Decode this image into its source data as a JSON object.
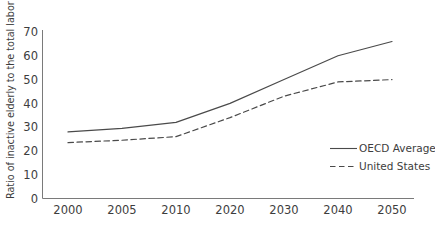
{
  "chart_data": {
    "type": "line",
    "title": "",
    "xlabel": "",
    "ylabel": "Ratio of inactive elderly to the total labor force",
    "categories": [
      "2000",
      "2005",
      "2010",
      "2020",
      "2030",
      "2040",
      "2050"
    ],
    "x_tick_labels": [
      "2000",
      "2005",
      "2010",
      "2020",
      "2030",
      "2040",
      "2050"
    ],
    "y_tick_labels": [
      "0",
      "10",
      "20",
      "30",
      "40",
      "50",
      "60",
      "70"
    ],
    "y_ticks": [
      0,
      10,
      20,
      30,
      40,
      50,
      60,
      70
    ],
    "ylim": [
      0,
      70
    ],
    "grid": false,
    "legend_position": "bottom-right",
    "series": [
      {
        "name": "OECD Average",
        "style": "solid",
        "color": "#4a4a4a",
        "values": [
          28,
          29.5,
          32,
          40,
          50,
          60,
          66
        ]
      },
      {
        "name": "United States",
        "style": "dashed",
        "color": "#4a4a4a",
        "values": [
          23.5,
          24.5,
          26,
          34,
          43,
          49,
          50
        ]
      }
    ]
  },
  "legend": {
    "items": [
      {
        "label": "OECD Average",
        "style": "solid"
      },
      {
        "label": "United States",
        "style": "dashed"
      }
    ]
  },
  "colors": {
    "line": "#4a4a4a",
    "axis": "#7a7a7a",
    "text": "#3d3d3d",
    "background": "#ffffff"
  }
}
